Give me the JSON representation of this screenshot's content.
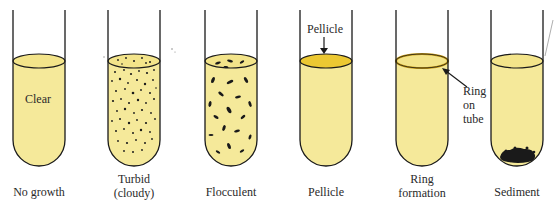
{
  "figure": {
    "colors": {
      "broth": "#f5e99a",
      "broth_surface": "#f3e48a",
      "pellicle": "#ecc832",
      "outline": "#1a1a1a",
      "particles": "#1a1a1a"
    },
    "tubes": [
      {
        "id": "no-growth",
        "caption": "No growth",
        "inner_label": "Clear"
      },
      {
        "id": "turbid",
        "caption_line1": "Turbid",
        "caption_line2": "(cloudy)"
      },
      {
        "id": "flocculent",
        "caption": "Flocculent"
      },
      {
        "id": "pellicle",
        "caption": "Pellicle",
        "callout": "Pellicle"
      },
      {
        "id": "ring",
        "caption_line1": "Ring",
        "caption_line2": "formation",
        "callout_line1": "Ring",
        "callout_line2": "on",
        "callout_line3": "tube"
      },
      {
        "id": "sediment",
        "caption": "Sediment"
      }
    ]
  }
}
